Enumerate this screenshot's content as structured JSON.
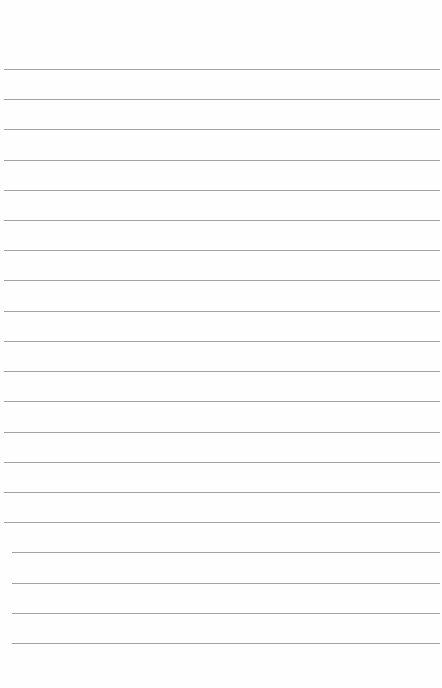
{
  "page": {
    "type": "lined-paper",
    "content_text": "",
    "rule_count": 20,
    "rule_color": "#a3a3a3",
    "background_color": "#fefefe"
  }
}
